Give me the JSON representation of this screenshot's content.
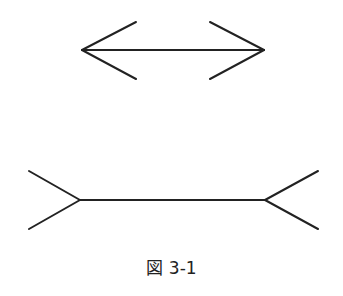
{
  "figure": {
    "caption": "図 3-1",
    "stroke_color": "#222222",
    "top_figure": {
      "type": "arrowheads-inward",
      "description": "line with outward-pointing arrowheads"
    },
    "bottom_figure": {
      "type": "fins-outward",
      "description": "line with outward fins"
    }
  }
}
